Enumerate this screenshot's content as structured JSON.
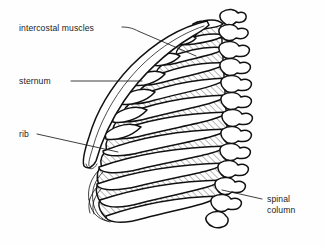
{
  "figure": {
    "background_color": "#fefefe",
    "line_color": "#111111",
    "text_color": "#1c1c1c",
    "hatch_color": "#9a9a9a"
  },
  "labels": [
    {
      "id": "intercostal-muscles",
      "text": "intercostal muscles",
      "text_x": 19,
      "text_y": 31,
      "anchor": "start",
      "leader": "M 122,27 L 138,31 M 138,31 L 196,56",
      "target": "hatched intercostal space"
    },
    {
      "id": "sternum",
      "text": "sternum",
      "text_x": 19,
      "text_y": 84,
      "anchor": "start",
      "leader": "M 71,81 L 142,81",
      "target": "anterior sternum band"
    },
    {
      "id": "rib",
      "text": "rib",
      "text_x": 19,
      "text_y": 137,
      "anchor": "start",
      "leader": "M 37,134 L 118,152",
      "target": "individual rib bone"
    },
    {
      "id": "spinal-column",
      "line1": "spinal",
      "line2": "column",
      "text_x": 267,
      "text_y": 202,
      "text_y2": 213,
      "anchor": "start",
      "leader": "M 262,199 L 222,190",
      "target": "vertebral column"
    }
  ],
  "structures": {
    "rib_count": 11,
    "vertebra_count": 11,
    "hatch_angle_degrees": 45,
    "hatch_spacing_px": 3.2
  }
}
